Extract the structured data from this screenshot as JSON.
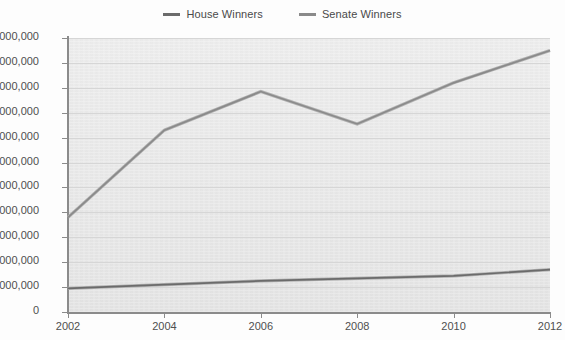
{
  "legend": {
    "position": "top-center",
    "items": [
      {
        "label": "House Winners",
        "color": "#6b6b6b",
        "icon": "line-swatch-icon"
      },
      {
        "label": "Senate Winners",
        "color": "#8a8a8a",
        "icon": "line-swatch-icon"
      }
    ]
  },
  "axes": {
    "y_tick_labels": [
      "11,000,000",
      "10,000,000",
      "9,000,000",
      "8,000,000",
      "7,000,000",
      "6,000,000",
      "5,000,000",
      "4,000,000",
      "3,000,000",
      "2,000,000",
      "1,000,000",
      "0"
    ],
    "x_tick_labels": [
      "2002",
      "2004",
      "2006",
      "2008",
      "2010",
      "2012"
    ]
  },
  "colors": {
    "plot_background": "#ebebeb",
    "gridline": "#d6d6d6",
    "axis": "#8b8b8b",
    "text": "#4f4f4f",
    "house_line": "#6b6b6b",
    "senate_line": "#8a8a8a"
  },
  "chart_data": {
    "type": "line",
    "title": "",
    "subtitle": "",
    "xlabel": "",
    "ylabel": "",
    "x": [
      2002,
      2004,
      2006,
      2008,
      2010,
      2012
    ],
    "categories": [
      "2002",
      "2004",
      "2006",
      "2008",
      "2010",
      "2012"
    ],
    "series": [
      {
        "name": "House Winners",
        "color": "#6b6b6b",
        "values": [
          950000,
          1100000,
          1250000,
          1350000,
          1450000,
          1700000
        ]
      },
      {
        "name": "Senate Winners",
        "color": "#8a8a8a",
        "values": [
          3800000,
          7300000,
          8850000,
          7550000,
          9200000,
          10500000
        ]
      }
    ],
    "ylim": [
      0,
      11000000
    ],
    "xlim": [
      2002,
      2012
    ],
    "ytick_values": [
      0,
      1000000,
      2000000,
      3000000,
      4000000,
      5000000,
      6000000,
      7000000,
      8000000,
      9000000,
      10000000,
      11000000
    ],
    "grid": true,
    "grid_axis": "y",
    "legend_position": "top-center"
  }
}
